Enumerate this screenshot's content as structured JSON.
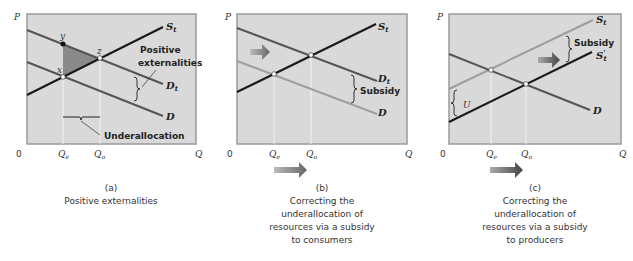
{
  "colors": {
    "panel_bg": "#d9d9d9",
    "frame": "#9a9a9a",
    "dark_line": "#1a1a1a",
    "mid_line": "#555555",
    "light_line": "#9e9e9e",
    "shade": "#8a8a8a"
  },
  "panels": [
    {
      "id": "a",
      "letter": "(a)",
      "caption": [
        "Positive externalities"
      ],
      "axis": {
        "y": "P",
        "x": "Q",
        "origin": "0",
        "qe": "Qe",
        "qo": "Qo"
      },
      "labels": {
        "st": "St",
        "dt": "Dt",
        "d": "D",
        "point_x": "x",
        "point_y": "y",
        "point_z": "z",
        "positive": "Positive",
        "externalities": "externalities",
        "underallocation": "Underallocation"
      }
    },
    {
      "id": "b",
      "letter": "(b)",
      "caption": [
        "Correcting the",
        "underallocation of",
        "resources via a subsidy",
        "to consumers"
      ],
      "axis": {
        "y": "P",
        "x": "Q",
        "origin": "0",
        "qe": "Qe",
        "qo": "Qo"
      },
      "labels": {
        "st": "St",
        "dt": "Dt",
        "d": "D",
        "subsidy": "Subsidy"
      }
    },
    {
      "id": "c",
      "letter": "(c)",
      "caption": [
        "Correcting the",
        "underallocation of",
        "resources via a subsidy",
        "to producers"
      ],
      "axis": {
        "y": "P",
        "x": "Q",
        "origin": "0",
        "qe": "Qe",
        "qo": "Qo"
      },
      "labels": {
        "st": "St",
        "st_prime": "S't",
        "d": "D",
        "subsidy": "Subsidy",
        "u": "U"
      }
    }
  ]
}
